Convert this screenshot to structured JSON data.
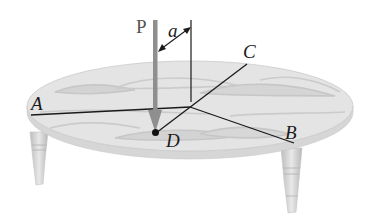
{
  "figure": {
    "labels": {
      "P": "P",
      "a": "a",
      "A": "A",
      "B": "B",
      "C": "C",
      "D": "D"
    },
    "colors": {
      "table_top": "#e2e2e2",
      "table_grain": "#c6c6c6",
      "table_edge": "#d4d4d4",
      "legs": "#cfcfcf",
      "load_arrow": "#8f8f8f",
      "lines": "#1a1a1a",
      "background": "#ffffff"
    }
  }
}
